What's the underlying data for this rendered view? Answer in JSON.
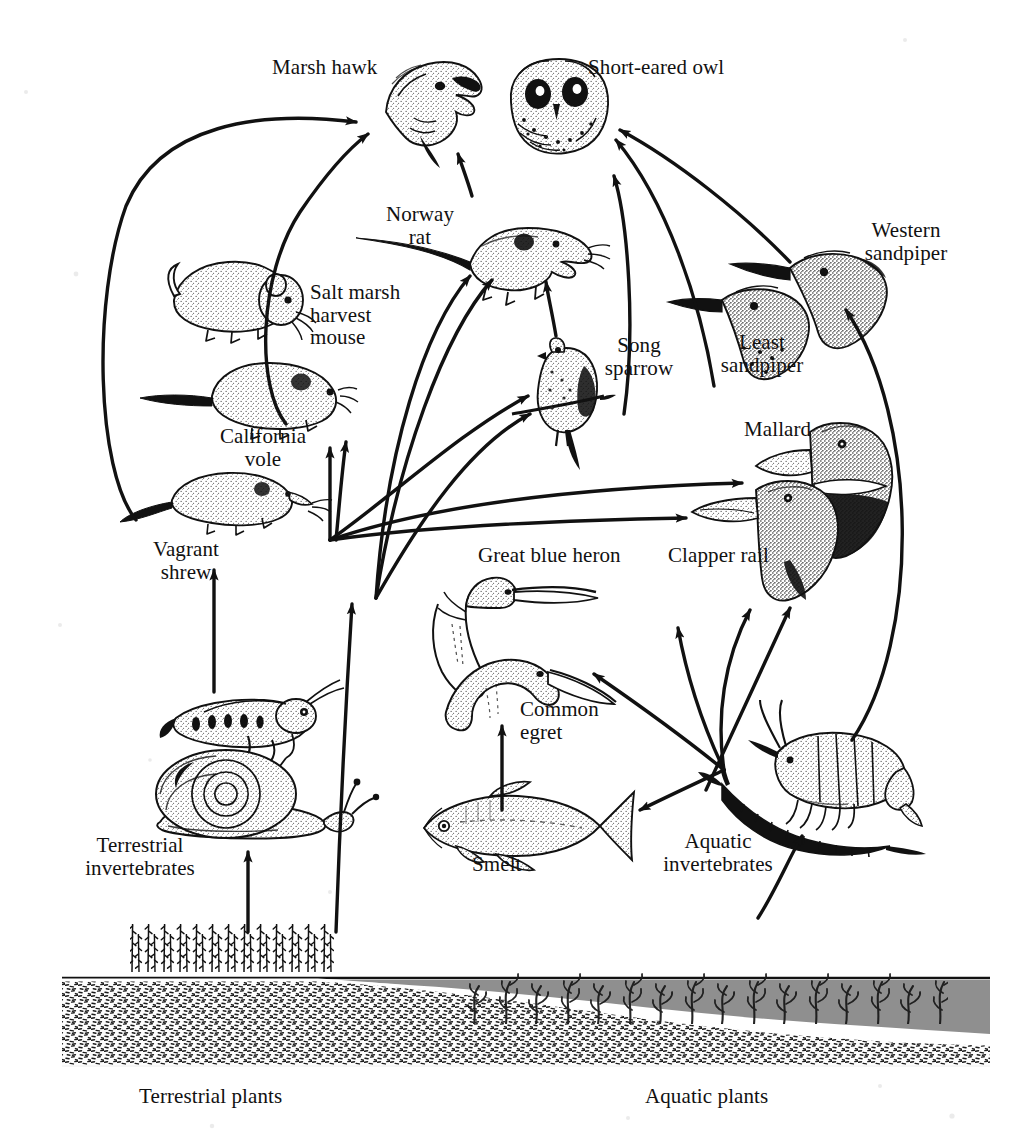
{
  "figure": {
    "type": "ecological food web diagram",
    "background_color": "#ffffff",
    "ink_color": "#111111",
    "water_color": "#8f8f8f"
  },
  "labels": {
    "marsh_hawk": "Marsh hawk",
    "short_eared_owl": "Short-eared owl",
    "norway_rat": "Norway\nrat",
    "salt_marsh_harvest_mouse": "Salt marsh\nharvest\nmouse",
    "california_vole": "California\nvole",
    "vagrant_shrew": "Vagrant\nshrew",
    "song_sparrow": "Song\nsparrow",
    "western_sandpiper": "Western\nsandpiper",
    "least_sandpiper": "Least\nsandpiper",
    "mallard": "Mallard",
    "clapper_rail": "Clapper rail",
    "great_blue_heron": "Great blue heron",
    "common_egret": "Common\negret",
    "smelt": "Smelt",
    "terrestrial_invertebrates": "Terrestrial\ninvertebrates",
    "aquatic_invertebrates": "Aquatic\ninvertebrates",
    "terrestrial_plants": "Terrestrial plants",
    "aquatic_plants": "Aquatic plants"
  },
  "organisms": [
    {
      "id": "marsh-hawk",
      "name": "Marsh hawk",
      "icon": "hawk-head-icon",
      "trophic_level": "top predator",
      "habitat": "terrestrial"
    },
    {
      "id": "short-eared-owl",
      "name": "Short-eared owl",
      "icon": "owl-head-icon",
      "trophic_level": "top predator",
      "habitat": "terrestrial"
    },
    {
      "id": "norway-rat",
      "name": "Norway rat",
      "icon": "rat-icon",
      "trophic_level": "omnivore",
      "habitat": "terrestrial"
    },
    {
      "id": "salt-marsh-harvest-mouse",
      "name": "Salt marsh harvest mouse",
      "icon": "mouse-icon",
      "trophic_level": "herbivore",
      "habitat": "terrestrial"
    },
    {
      "id": "california-vole",
      "name": "California vole",
      "icon": "vole-icon",
      "trophic_level": "herbivore",
      "habitat": "terrestrial"
    },
    {
      "id": "vagrant-shrew",
      "name": "Vagrant shrew",
      "icon": "shrew-icon",
      "trophic_level": "insectivore",
      "habitat": "terrestrial"
    },
    {
      "id": "song-sparrow",
      "name": "Song sparrow",
      "icon": "sparrow-icon",
      "trophic_level": "insectivore",
      "habitat": "terrestrial"
    },
    {
      "id": "western-sandpiper",
      "name": "Western sandpiper",
      "icon": "sandpiper-head-icon",
      "trophic_level": "invertivore",
      "habitat": "aquatic"
    },
    {
      "id": "least-sandpiper",
      "name": "Least sandpiper",
      "icon": "sandpiper-head-icon",
      "trophic_level": "invertivore",
      "habitat": "aquatic"
    },
    {
      "id": "mallard",
      "name": "Mallard",
      "icon": "duck-head-icon",
      "trophic_level": "omnivore",
      "habitat": "aquatic"
    },
    {
      "id": "clapper-rail",
      "name": "Clapper rail",
      "icon": "rail-head-icon",
      "trophic_level": "invertivore",
      "habitat": "aquatic"
    },
    {
      "id": "great-blue-heron",
      "name": "Great blue heron",
      "icon": "heron-icon",
      "trophic_level": "piscivore",
      "habitat": "aquatic"
    },
    {
      "id": "common-egret",
      "name": "Common egret",
      "icon": "egret-icon",
      "trophic_level": "piscivore",
      "habitat": "aquatic"
    },
    {
      "id": "smelt",
      "name": "Smelt",
      "icon": "fish-icon",
      "trophic_level": "planktivore",
      "habitat": "aquatic"
    },
    {
      "id": "terrestrial-invertebrates",
      "name": "Terrestrial invertebrates",
      "icon": "grasshopper-snail-icon",
      "trophic_level": "primary consumer",
      "habitat": "terrestrial"
    },
    {
      "id": "aquatic-invertebrates",
      "name": "Aquatic invertebrates",
      "icon": "shrimp-worm-icon",
      "trophic_level": "primary consumer",
      "habitat": "aquatic"
    },
    {
      "id": "terrestrial-plants",
      "name": "Terrestrial plants",
      "icon": "marsh-grass-icon",
      "trophic_level": "producer",
      "habitat": "terrestrial"
    },
    {
      "id": "aquatic-plants",
      "name": "Aquatic plants",
      "icon": "seaweed-icon",
      "trophic_level": "producer",
      "habitat": "aquatic"
    }
  ],
  "feeding_links": [
    {
      "from": "terrestrial-plants",
      "to": "terrestrial-invertebrates"
    },
    {
      "from": "terrestrial-plants",
      "to": "norway-rat"
    },
    {
      "from": "terrestrial-invertebrates",
      "to": "vagrant-shrew"
    },
    {
      "from": "terrestrial-invertebrates",
      "to": "california-vole"
    },
    {
      "from": "terrestrial-invertebrates",
      "to": "salt-marsh-harvest-mouse"
    },
    {
      "from": "terrestrial-invertebrates",
      "to": "norway-rat"
    },
    {
      "from": "terrestrial-invertebrates",
      "to": "song-sparrow"
    },
    {
      "from": "terrestrial-invertebrates",
      "to": "mallard"
    },
    {
      "from": "terrestrial-invertebrates",
      "to": "clapper-rail"
    },
    {
      "from": "salt-marsh-harvest-mouse",
      "to": "marsh-hawk"
    },
    {
      "from": "california-vole",
      "to": "marsh-hawk"
    },
    {
      "from": "vagrant-shrew",
      "to": "marsh-hawk"
    },
    {
      "from": "norway-rat",
      "to": "marsh-hawk"
    },
    {
      "from": "song-sparrow",
      "to": "norway-rat"
    },
    {
      "from": "song-sparrow",
      "to": "short-eared-owl"
    },
    {
      "from": "least-sandpiper",
      "to": "short-eared-owl"
    },
    {
      "from": "western-sandpiper",
      "to": "short-eared-owl"
    },
    {
      "from": "aquatic-plants",
      "to": "aquatic-invertebrates"
    },
    {
      "from": "aquatic-invertebrates",
      "to": "smelt"
    },
    {
      "from": "aquatic-invertebrates",
      "to": "least-sandpiper"
    },
    {
      "from": "aquatic-invertebrates",
      "to": "western-sandpiper"
    },
    {
      "from": "aquatic-invertebrates",
      "to": "clapper-rail"
    },
    {
      "from": "aquatic-invertebrates",
      "to": "great-blue-heron"
    },
    {
      "from": "smelt",
      "to": "common-egret"
    },
    {
      "from": "smelt",
      "to": "great-blue-heron"
    }
  ],
  "habitat_cross_section": {
    "left_zone": "Terrestrial plants",
    "right_zone": "Aquatic plants",
    "substrate": "stippled sediment",
    "water": "shaded water column"
  }
}
